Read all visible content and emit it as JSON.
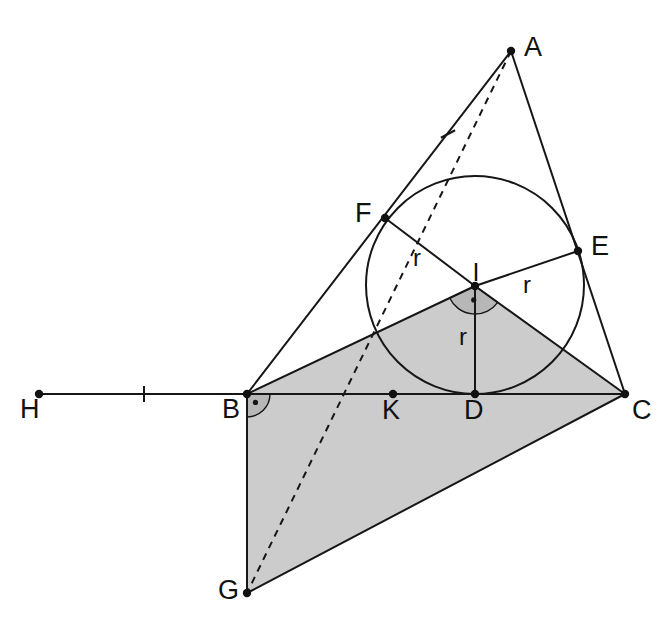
{
  "figure": {
    "type": "euclidean-geometry-diagram",
    "background_color": "#ffffff",
    "ink_color": "#161616",
    "shade_color": "#cccccc",
    "angle_arc_color": "#b3b3b3"
  },
  "points": {
    "A": {
      "label": "A",
      "x": 511,
      "y": 51,
      "lx": 524,
      "ly": 56,
      "dot": true
    },
    "F": {
      "label": "F",
      "x": 385,
      "y": 218,
      "lx": 355,
      "ly": 222,
      "dot": true
    },
    "E": {
      "label": "E",
      "x": 578,
      "y": 251,
      "lx": 591,
      "ly": 255,
      "dot": true
    },
    "I": {
      "label": "I",
      "x": 475,
      "y": 286,
      "lx": 476,
      "ly": 281,
      "dot": true
    },
    "H": {
      "label": "H",
      "x": 39,
      "y": 394,
      "lx": 20,
      "ly": 418,
      "dot": true
    },
    "B": {
      "label": "B",
      "x": 247,
      "y": 394,
      "lx": 222,
      "ly": 418,
      "dot": true
    },
    "K": {
      "label": "K",
      "x": 393,
      "y": 394,
      "lx": 382,
      "ly": 419,
      "dot": true
    },
    "D": {
      "label": "D",
      "x": 475,
      "y": 394,
      "lx": 464,
      "ly": 419,
      "dot": true
    },
    "C": {
      "label": "C",
      "x": 625,
      "y": 394,
      "lx": 632,
      "ly": 419,
      "dot": true
    },
    "G": {
      "label": "G",
      "x": 247,
      "y": 593,
      "lx": 218,
      "ly": 599,
      "dot": true
    }
  },
  "incircle": {
    "center_x": 475,
    "center_y": 285,
    "radius": 109,
    "label": "incircle"
  },
  "radii_labels": [
    {
      "text": "r",
      "x": 417,
      "y": 266,
      "name": "radius-label-IF"
    },
    {
      "text": "r",
      "x": 527,
      "y": 293,
      "name": "radius-label-IE"
    },
    {
      "text": "r",
      "x": 463,
      "y": 345,
      "name": "radius-label-ID"
    }
  ],
  "segments": [
    {
      "name": "segment-AB",
      "from": "A",
      "to": "B"
    },
    {
      "name": "segment-AC",
      "from": "A",
      "to": "C"
    },
    {
      "name": "segment-BC",
      "from": "B",
      "to": "C"
    },
    {
      "name": "segment-HB",
      "from": "H",
      "to": "B"
    },
    {
      "name": "segment-IF",
      "from": "I",
      "to": "F"
    },
    {
      "name": "segment-IE",
      "from": "I",
      "to": "E"
    },
    {
      "name": "segment-ID",
      "from": "I",
      "to": "D"
    },
    {
      "name": "segment-IB",
      "from": "I",
      "to": "B"
    },
    {
      "name": "segment-IC",
      "from": "I",
      "to": "C"
    },
    {
      "name": "segment-BG",
      "from": "B",
      "to": "G"
    },
    {
      "name": "segment-GC",
      "from": "G",
      "to": "C"
    }
  ],
  "dashed_segments": [
    {
      "name": "dashed-line-A-I-K-G",
      "from": "A",
      "to": "G",
      "through": [
        "I",
        "K"
      ]
    }
  ],
  "shaded_polygon": {
    "name": "shaded-quadrilateral-BICG",
    "vertices": [
      "B",
      "I",
      "C",
      "G"
    ],
    "fill": "#cccccc"
  },
  "tick_marks": [
    {
      "name": "tick-mark-HB",
      "x": 144,
      "y": 394,
      "angle": 0
    },
    {
      "name": "tick-mark-AB",
      "x": 448,
      "y": 134,
      "angle": 62
    }
  ],
  "angle_marks": [
    {
      "name": "angle-mark-at-B",
      "vertex": "B",
      "radius": 23,
      "start_deg": 0,
      "end_deg": 90,
      "dot": true
    },
    {
      "name": "angle-mark-at-I",
      "vertex": "I",
      "radius": 28,
      "start_deg": 25,
      "end_deg": 155,
      "dot": true
    }
  ]
}
